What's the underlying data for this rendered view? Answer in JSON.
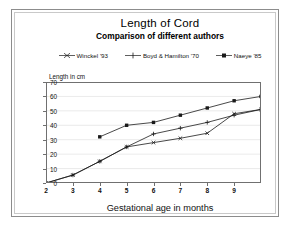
{
  "title": "Length of Cord",
  "subtitle": "Comparison of different authors",
  "axis": {
    "ylabel": "Length in cm",
    "xlabel": "Gestational age in months"
  },
  "colors": {
    "line": "#1a1a1a",
    "grid": "#dcdcdc",
    "frame": "#707070",
    "outer_frame": "#8c8c8c",
    "background": "#ffffff"
  },
  "chart_data": {
    "type": "line",
    "title": "Length of Cord",
    "subtitle": "Comparison of different authors",
    "xlabel": "Gestational age in months",
    "ylabel": "Length in cm",
    "xlim": [
      2,
      10
    ],
    "ylim": [
      0,
      70
    ],
    "xticks": [
      2,
      3,
      4,
      5,
      6,
      7,
      8,
      9
    ],
    "yticks": [
      0,
      10,
      20,
      30,
      40,
      50,
      60,
      70
    ],
    "grid": true,
    "legend_position": "top",
    "series": [
      {
        "name": "Winckel '93",
        "marker": "cross",
        "x": [
          2,
          3,
          4,
          5,
          6,
          7,
          8,
          9,
          10
        ],
        "y": [
          0,
          5.5,
          15,
          25,
          28,
          31,
          34.5,
          48,
          51
        ]
      },
      {
        "name": "Boyd & Hamilton '70",
        "marker": "plus",
        "x": [
          2,
          3,
          4,
          5,
          6,
          7,
          8,
          9,
          10
        ],
        "y": [
          0,
          5.5,
          15,
          25,
          34,
          38,
          42,
          47,
          51
        ]
      },
      {
        "name": "Naeye '85",
        "marker": "square",
        "x": [
          4,
          5,
          6,
          7,
          8,
          9,
          10
        ],
        "y": [
          32,
          40,
          42,
          47,
          52,
          57,
          60
        ]
      }
    ]
  }
}
